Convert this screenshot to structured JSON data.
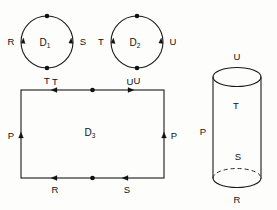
{
  "figure": {
    "background_color": "#fdfdfc",
    "ink_color": "#111111"
  },
  "circle_d1": {
    "region_label": "D",
    "region_subscript": "1",
    "edge_left_label": "R",
    "edge_right_label": "S",
    "edge_bottom_label": "T",
    "vertex_count": 2,
    "arrow_directions": [
      "up",
      "up"
    ]
  },
  "circle_d2": {
    "region_label": "D",
    "region_subscript": "2",
    "edge_left_label": "T",
    "edge_right_label": "U",
    "edge_bottom_label": "U",
    "vertex_count": 2,
    "arrow_directions": [
      "up",
      "up"
    ]
  },
  "rectangle_d3": {
    "region_label": "D",
    "region_subscript": "3",
    "top_left_label": "T",
    "top_right_label": "U",
    "left_label": "P",
    "right_label": "P",
    "bottom_left_label": "R",
    "bottom_right_label": "S",
    "arrow_top_left": "left",
    "arrow_top_right": "right",
    "arrow_left": "up",
    "arrow_right": "up",
    "arrow_bottom_left": "left",
    "arrow_bottom_right": "left",
    "vertex_count": 2
  },
  "cylinder": {
    "top_label": "U",
    "upper_side_label": "T",
    "left_label": "P",
    "lower_side_label": "S",
    "bottom_label": "R",
    "hidden_edge_style": "dashed"
  }
}
